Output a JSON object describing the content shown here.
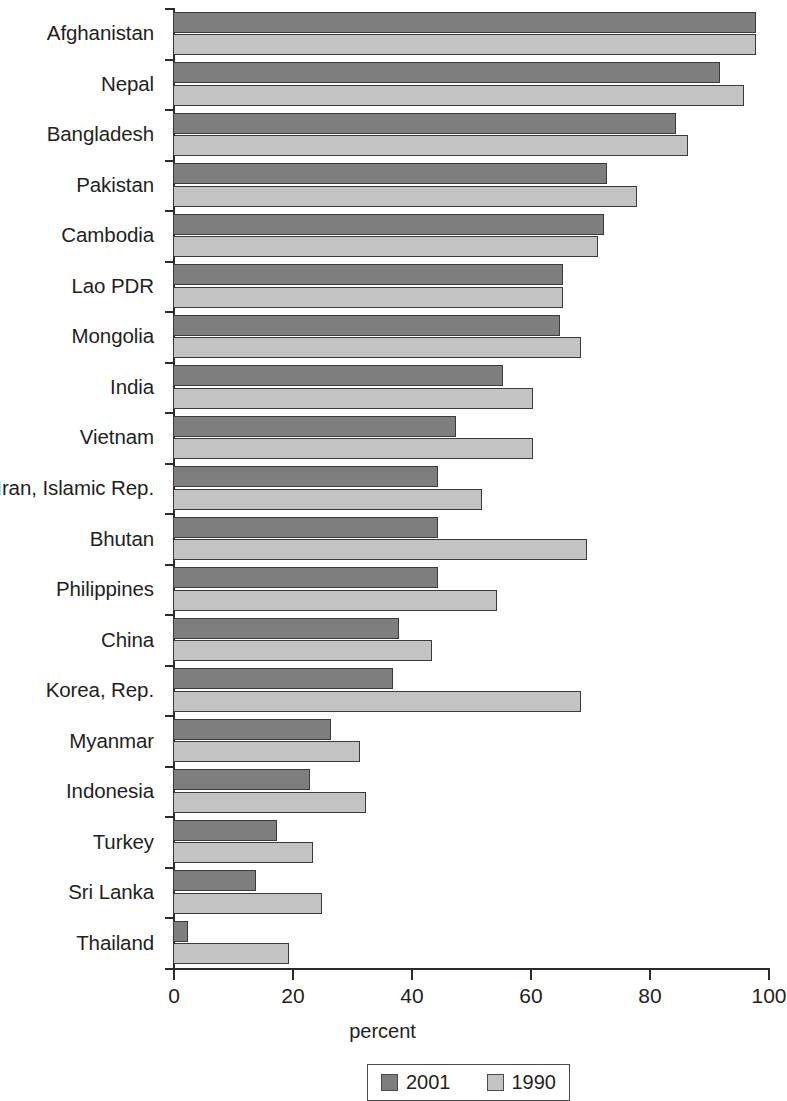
{
  "chart_data": {
    "type": "bar",
    "orientation": "horizontal",
    "title": "",
    "xlabel": "percent",
    "ylabel": "",
    "xlim": [
      0,
      100
    ],
    "xticks": [
      0,
      20,
      40,
      60,
      80,
      100
    ],
    "grid": false,
    "legend_position": "bottom-center",
    "categories": [
      "Afghanistan",
      "Nepal",
      "Bangladesh",
      "Pakistan",
      "Cambodia",
      "Lao PDR",
      "Mongolia",
      "India",
      "Vietnam",
      "Iran, Islamic Rep.",
      "Bhutan",
      "Philippines",
      "China",
      "Korea, Rep.",
      "Myanmar",
      "Indonesia",
      "Turkey",
      "Sri Lanka",
      "Thailand"
    ],
    "series": [
      {
        "name": "2001",
        "color": "#7e7e7e",
        "values": [
          98,
          92,
          84.5,
          73,
          72.5,
          65.5,
          65,
          55.5,
          47.5,
          44.5,
          44.5,
          44.5,
          38,
          37,
          26.5,
          23,
          17.5,
          14,
          2.5
        ]
      },
      {
        "name": "1990",
        "color": "#c3c3c3",
        "values": [
          98,
          96,
          86.5,
          78,
          71.5,
          65.5,
          68.5,
          60.5,
          60.5,
          52,
          69.5,
          54.5,
          43.5,
          68.5,
          31.5,
          32.5,
          23.5,
          25,
          19.5
        ]
      }
    ]
  },
  "legend": {
    "items": [
      {
        "label": "2001",
        "series_key": "s2001"
      },
      {
        "label": "1990",
        "series_key": "s1990"
      }
    ]
  },
  "axis": {
    "x_title": "percent",
    "tick_labels": [
      "0",
      "20",
      "40",
      "60",
      "80",
      "100"
    ]
  }
}
